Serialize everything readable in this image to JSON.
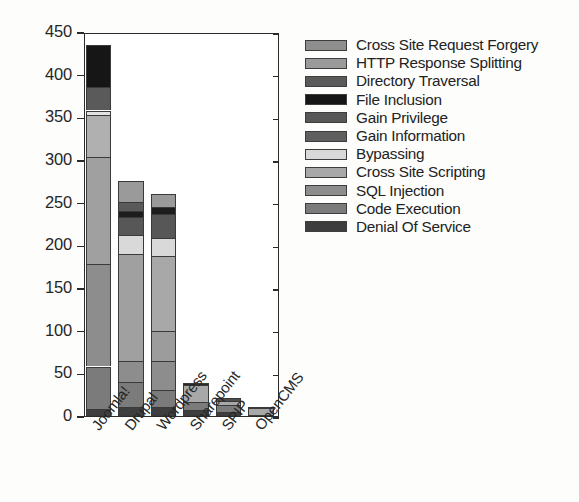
{
  "chart_data": {
    "type": "bar",
    "subtype": "stacked-bar",
    "title": "",
    "xlabel": "",
    "ylabel": "",
    "ylim": [
      0,
      450
    ],
    "ytick_step": 50,
    "yticks": [
      0,
      50,
      100,
      150,
      200,
      250,
      300,
      350,
      400,
      450
    ],
    "grid": false,
    "legend_position": "right",
    "categories": [
      "Joomla!",
      "Drupal",
      "Wordpress",
      "Sharepoint",
      "SPIP",
      "OpenCMS"
    ],
    "stack_order_bottom_to_top": [
      "Denial Of Service",
      "Code Execution",
      "SQL Injection",
      "Cross Site Scripting",
      "Bypassing",
      "Gain Information",
      "Gain Privilege",
      "File Inclusion",
      "Directory Traversal",
      "HTTP Response Splitting",
      "Cross Site Request Forgery"
    ],
    "series": [
      {
        "name": "Cross Site Request Forgery",
        "color": "#8e8e8e",
        "values": [
          0,
          0,
          0,
          0,
          0,
          0
        ]
      },
      {
        "name": "HTTP Response Splitting",
        "color": "#9a9a9a",
        "values": [
          0,
          0,
          0,
          0,
          0,
          0
        ]
      },
      {
        "name": "Directory Traversal",
        "color": "#5a5a5a",
        "values": [
          27,
          8,
          6,
          0,
          0,
          0
        ]
      },
      {
        "name": "File Inclusion",
        "color": "#161616",
        "values": [
          50,
          7,
          7,
          3,
          0,
          0
        ]
      },
      {
        "name": "Gain Privilege",
        "color": "#575757",
        "values": [
          0,
          9,
          9,
          0,
          0,
          0
        ]
      },
      {
        "name": "Gain Information",
        "color": "#5f5f5f",
        "values": [
          0,
          0,
          0,
          0,
          0,
          0
        ]
      },
      {
        "name": "Bypassing",
        "color": "#d9d9d9",
        "values": [
          5,
          22,
          22,
          0,
          0,
          0
        ]
      },
      {
        "name": "Cross Site Scripting",
        "color": "#a8a8a8",
        "values": [
          125,
          103,
          121,
          20,
          8,
          11
        ]
      },
      {
        "name": "SQL Injection",
        "color": "#8d8d8d",
        "values": [
          170,
          43,
          35,
          0,
          0,
          0
        ]
      },
      {
        "name": "Code Execution",
        "color": "#7b7b7b",
        "values": [
          50,
          72,
          42,
          9,
          8,
          0
        ]
      },
      {
        "name": "Denial Of Service",
        "color": "#3e3e3e",
        "values": [
          8,
          11,
          18,
          7,
          5,
          0
        ]
      }
    ],
    "totals": [
      435,
      275,
      260,
      39,
      21,
      11
    ],
    "legend_entries": [
      "Cross Site Request Forgery",
      "HTTP Response Splitting",
      "Directory Traversal",
      "File Inclusion",
      "Gain Privilege",
      "Gain Information",
      "Bypassing",
      "Cross Site Scripting",
      "SQL Injection",
      "Code Execution",
      "Denial Of Service"
    ],
    "legend_colors": [
      "#8e8e8e",
      "#9a9a9a",
      "#5a5a5a",
      "#161616",
      "#575757",
      "#5f5f5f",
      "#d9d9d9",
      "#a8a8a8",
      "#8d8d8d",
      "#7b7b7b",
      "#3e3e3e"
    ],
    "bars": [
      {
        "category": "Joomla!",
        "total": 435,
        "segments": [
          {
            "name": "Denial Of Service",
            "value": 8,
            "y0": 0,
            "y1": 8,
            "color": "#3e3e3e"
          },
          {
            "name": "Code Execution",
            "value": 50,
            "y0": 8,
            "y1": 58,
            "color": "#7b7b7b"
          },
          {
            "name": "SQL Injection",
            "value": 120,
            "y0": 58,
            "y1": 178,
            "color": "#8d8d8d"
          },
          {
            "name": "Cross Site Scripting",
            "value": 125,
            "y0": 178,
            "y1": 303,
            "color": "#a0a0a0"
          },
          {
            "name": "Gain Information",
            "value": 50,
            "y0": 303,
            "y1": 353,
            "color": "#b0b0b0"
          },
          {
            "name": "Bypassing",
            "value": 5,
            "y0": 353,
            "y1": 358,
            "color": "#e2e2e2"
          },
          {
            "name": "Directory Traversal",
            "value": 27,
            "y0": 358,
            "y1": 385,
            "color": "#5a5a5a"
          },
          {
            "name": "File Inclusion",
            "value": 50,
            "y0": 385,
            "y1": 435,
            "color": "#161616"
          }
        ]
      },
      {
        "category": "Drupal",
        "total": 275,
        "segments": [
          {
            "name": "Denial Of Service",
            "value": 11,
            "y0": 0,
            "y1": 11,
            "color": "#3e3e3e"
          },
          {
            "name": "Code Execution",
            "value": 29,
            "y0": 11,
            "y1": 40,
            "color": "#7b7b7b"
          },
          {
            "name": "SQL Injection",
            "value": 25,
            "y0": 40,
            "y1": 65,
            "color": "#8d8d8d"
          },
          {
            "name": "Cross Site Scripting",
            "value": 125,
            "y0": 65,
            "y1": 190,
            "color": "#a0a0a0"
          },
          {
            "name": "Bypassing",
            "value": 22,
            "y0": 190,
            "y1": 212,
            "color": "#d9d9d9"
          },
          {
            "name": "Gain Privilege",
            "value": 21,
            "y0": 212,
            "y1": 233,
            "color": "#575757"
          },
          {
            "name": "File Inclusion",
            "value": 7,
            "y0": 233,
            "y1": 240,
            "color": "#1d1d1d"
          },
          {
            "name": "Directory Traversal",
            "value": 11,
            "y0": 240,
            "y1": 251,
            "color": "#5a5a5a"
          },
          {
            "name": "HTTP Response Splitting",
            "value": 24,
            "y0": 251,
            "y1": 275,
            "color": "#9a9a9a"
          }
        ]
      },
      {
        "category": "Wordpress",
        "total": 260,
        "segments": [
          {
            "name": "Denial Of Service",
            "value": 10,
            "y0": 0,
            "y1": 10,
            "color": "#3e3e3e"
          },
          {
            "name": "Code Execution",
            "value": 20,
            "y0": 10,
            "y1": 30,
            "color": "#7b7b7b"
          },
          {
            "name": "SQL Injection",
            "value": 35,
            "y0": 30,
            "y1": 65,
            "color": "#8d8d8d"
          },
          {
            "name": "Cross Site Scripting",
            "value": 35,
            "y0": 65,
            "y1": 100,
            "color": "#9c9c9c"
          },
          {
            "name": "Gain Information",
            "value": 88,
            "y0": 100,
            "y1": 188,
            "color": "#a8a8a8"
          },
          {
            "name": "Bypassing",
            "value": 21,
            "y0": 188,
            "y1": 209,
            "color": "#d9d9d9"
          },
          {
            "name": "Gain Privilege",
            "value": 28,
            "y0": 209,
            "y1": 237,
            "color": "#575757"
          },
          {
            "name": "File Inclusion",
            "value": 8,
            "y0": 237,
            "y1": 245,
            "color": "#1d1d1d"
          },
          {
            "name": "HTTP Response Splitting",
            "value": 15,
            "y0": 245,
            "y1": 260,
            "color": "#9a9a9a"
          }
        ]
      },
      {
        "category": "Sharepoint",
        "total": 39,
        "segments": [
          {
            "name": "Denial Of Service",
            "value": 7,
            "y0": 0,
            "y1": 7,
            "color": "#3e3e3e"
          },
          {
            "name": "Code Execution",
            "value": 9,
            "y0": 7,
            "y1": 16,
            "color": "#7b7b7b"
          },
          {
            "name": "Cross Site Scripting",
            "value": 20,
            "y0": 16,
            "y1": 36,
            "color": "#a8a8a8"
          },
          {
            "name": "File Inclusion",
            "value": 3,
            "y0": 36,
            "y1": 39,
            "color": "#2a2a2a"
          }
        ]
      },
      {
        "category": "SPIP",
        "total": 21,
        "segments": [
          {
            "name": "Denial Of Service",
            "value": 5,
            "y0": 0,
            "y1": 5,
            "color": "#3e3e3e"
          },
          {
            "name": "Code Execution",
            "value": 8,
            "y0": 5,
            "y1": 13,
            "color": "#7b7b7b"
          },
          {
            "name": "Cross Site Scripting",
            "value": 5,
            "y0": 13,
            "y1": 18,
            "color": "#a8a8a8"
          },
          {
            "name": "Directory Traversal",
            "value": 3,
            "y0": 18,
            "y1": 21,
            "color": "#4d4d4d"
          }
        ]
      },
      {
        "category": "OpenCMS",
        "total": 11,
        "segments": [
          {
            "name": "Cross Site Scripting",
            "value": 9,
            "y0": 0,
            "y1": 9,
            "color": "#a8a8a8"
          },
          {
            "name": "Code Execution",
            "value": 2,
            "y0": 9,
            "y1": 11,
            "color": "#6f6f6f"
          }
        ]
      }
    ]
  }
}
